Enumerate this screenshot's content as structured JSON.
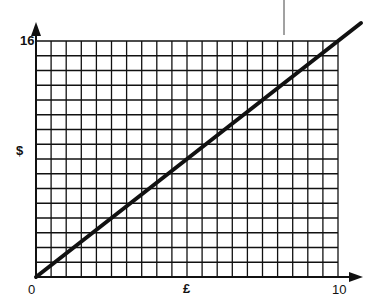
{
  "chart_data": {
    "type": "line",
    "title": "",
    "xlabel": "£",
    "ylabel": "$",
    "xlim": [
      0,
      10
    ],
    "ylim": [
      0,
      16
    ],
    "x_ticks": [
      "0",
      "10"
    ],
    "y_ticks": [
      "16"
    ],
    "grid": true,
    "grid_columns": 20,
    "grid_rows": 16,
    "series": [
      {
        "name": "conversion",
        "x": [
          0,
          10
        ],
        "values": [
          0,
          16
        ]
      }
    ]
  },
  "labels": {
    "origin": "0",
    "x_max": "10",
    "y_max": "16",
    "x_axis": "£",
    "y_axis": "$"
  }
}
